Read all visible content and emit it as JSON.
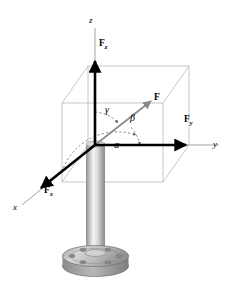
{
  "figure": {
    "background_color": "#ffffff",
    "axis_color": "#9a9a9a",
    "box_color": "#b9b9b9",
    "vector_color": "#000000",
    "force_vector_color": "#8a8a8a",
    "arc_color": "#6f6f6f",
    "post_light": "#f2f2f2",
    "post_mid": "#c9c9c9",
    "post_dark": "#8f8f8f",
    "base_fill": "#c4c4c4",
    "base_edge": "#6e6e6e"
  },
  "axes": [
    {
      "key": "z",
      "label": "z",
      "desc": "vertical-axis"
    },
    {
      "key": "y",
      "label": "y",
      "desc": "right-axis"
    },
    {
      "key": "x",
      "label": "x",
      "desc": "front-left-axis"
    }
  ],
  "vectors": [
    {
      "key": "F",
      "label": "F",
      "sub": "",
      "desc": "resultant-force"
    },
    {
      "key": "Fz",
      "label": "F",
      "sub": "z",
      "desc": "z-component"
    },
    {
      "key": "Fy",
      "label": "F",
      "sub": "y",
      "desc": "y-component"
    },
    {
      "key": "Fx",
      "label": "F",
      "sub": "x",
      "desc": "x-component"
    }
  ],
  "angles": [
    {
      "key": "alpha",
      "label": "α",
      "desc": "angle-from-x-axis"
    },
    {
      "key": "beta",
      "label": "β",
      "desc": "angle-from-y-axis"
    },
    {
      "key": "gamma",
      "label": "γ",
      "desc": "angle-from-z-axis"
    }
  ],
  "object": {
    "name": "flanged-cylindrical-post",
    "bolt_hole_count": 6
  }
}
